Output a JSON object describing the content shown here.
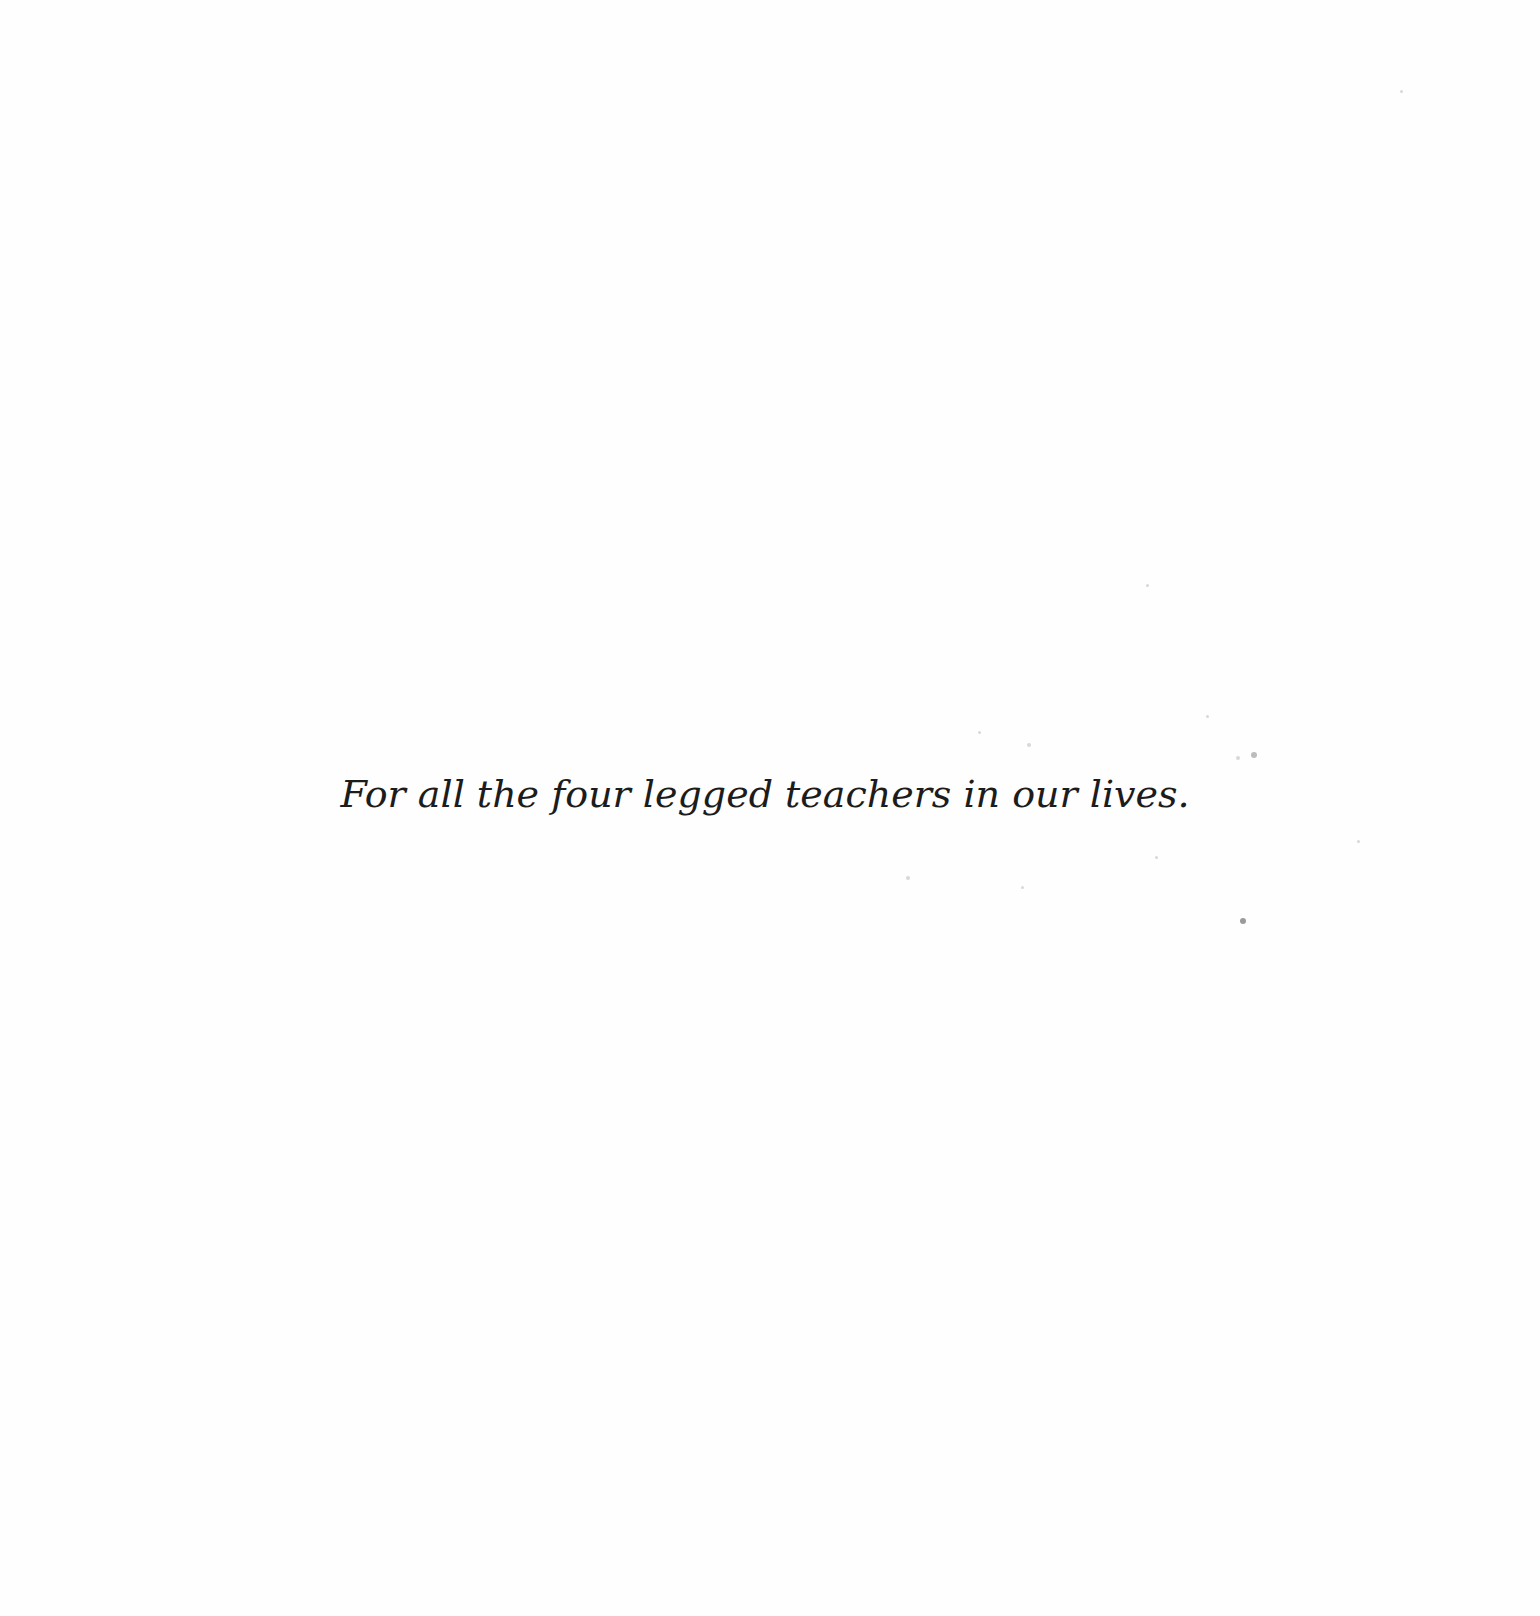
{
  "page": {
    "type": "dedication",
    "dedication_text": "For all the four legged teachers in our lives.",
    "colors": {
      "background": "#fefefe",
      "text": "#1c1c1c"
    }
  }
}
